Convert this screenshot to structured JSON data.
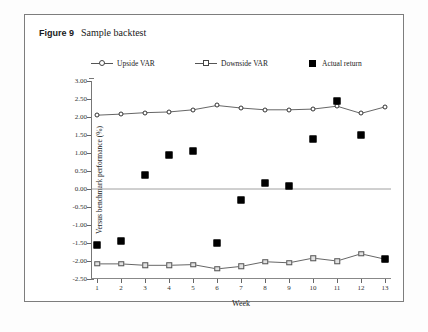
{
  "figure": {
    "label": "Figure 9",
    "caption": "Sample backtest"
  },
  "chart_data": {
    "type": "line",
    "title": "Sample backtest",
    "xlabel": "Week",
    "ylabel": "Versus benchmark performance (%)",
    "categories": [
      "1",
      "2",
      "3",
      "4",
      "5",
      "6",
      "7",
      "8",
      "9",
      "10",
      "11",
      "12",
      "13"
    ],
    "x": [
      1,
      2,
      3,
      4,
      5,
      6,
      7,
      8,
      9,
      10,
      11,
      12,
      13
    ],
    "ylim": [
      -2.5,
      3.0
    ],
    "xlim": [
      1,
      13
    ],
    "ytick_labels": [
      "3.00",
      "2.50",
      "2.00",
      "1.50",
      "1.00",
      "0.50",
      "0.00",
      "-0.50",
      "-1.00",
      "-1.50",
      "-2.00",
      "-2.50"
    ],
    "yticks": [
      3.0,
      2.5,
      2.0,
      1.5,
      1.0,
      0.5,
      0.0,
      -0.5,
      -1.0,
      -1.5,
      -2.0,
      -2.5
    ],
    "grid": false,
    "legend_position": "top",
    "series": [
      {
        "name": "Upside VAR",
        "marker": "open-circle",
        "values": [
          2.05,
          2.08,
          2.12,
          2.14,
          2.2,
          2.32,
          2.25,
          2.2,
          2.2,
          2.22,
          2.3,
          2.1,
          2.28
        ]
      },
      {
        "name": "Downside VAR",
        "marker": "open-square",
        "values": [
          -2.08,
          -2.08,
          -2.12,
          -2.12,
          -2.1,
          -2.22,
          -2.15,
          -2.02,
          -2.05,
          -1.92,
          -2.0,
          -1.8,
          -1.95
        ]
      },
      {
        "name": "Actual return",
        "marker": "filled-square",
        "line": false,
        "values": [
          -1.55,
          -1.45,
          0.4,
          0.95,
          1.05,
          -1.5,
          -0.3,
          0.18,
          0.07,
          1.4,
          2.45,
          1.5,
          -1.95
        ]
      }
    ]
  },
  "colors": {
    "line": "#555555",
    "marker_fill": "#ffffff",
    "downside_fill": "#e2e2e2",
    "actual_fill": "#000000",
    "frame": "#7d7d7d",
    "axis": "#777777"
  }
}
